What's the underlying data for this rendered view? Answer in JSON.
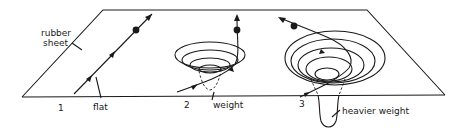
{
  "diagram": {
    "type": "physics-illustration",
    "labels": {
      "sheet": [
        "rubber",
        "sheet"
      ],
      "panel1_number": "1",
      "panel1_caption": "flat",
      "panel2_number": "2",
      "panel2_caption": "weight",
      "panel3_number": "3",
      "panel3_caption": "heavier weight"
    },
    "panels": [
      {
        "id": 1,
        "condition": "flat",
        "path": "straight line"
      },
      {
        "id": 2,
        "condition": "weight",
        "path": "slightly curved"
      },
      {
        "id": 3,
        "condition": "heavier weight",
        "path": "strongly curved / deflected"
      }
    ],
    "colors": {
      "ink": "#1a1a1a",
      "background": "#ffffff"
    }
  }
}
